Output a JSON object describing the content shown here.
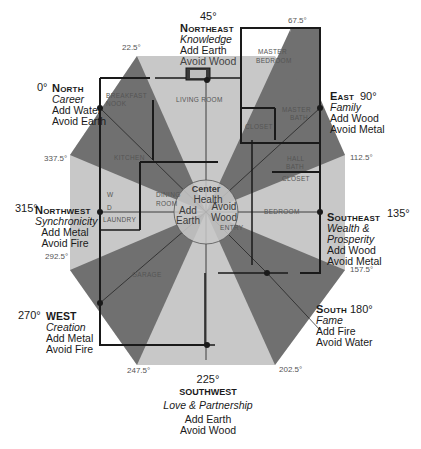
{
  "diagram": {
    "type": "feng-shui-bagua-floor-plan",
    "colors": {
      "dark_wedge": "#6f6f6f",
      "light_wedge": "#c8c8c8",
      "wall": "#1a1a1a",
      "background": "#ffffff"
    },
    "center": {
      "title": "Center",
      "area": "Health",
      "add": "Add Earth",
      "avoid": "Avoid Wood",
      "add_line1": "Add",
      "add_line2": "Earth",
      "avoid_line1": "Avoid",
      "avoid_line2": "Wood"
    },
    "directions": [
      {
        "id": "north",
        "degree": "0°",
        "name": "North",
        "area": "Career",
        "add": "Add Water",
        "avoid": "Avoid Earth"
      },
      {
        "id": "northeast",
        "degree": "45°",
        "name": "Northeast",
        "area": "Knowledge",
        "add": "Add Earth",
        "avoid": "Avoid Wood"
      },
      {
        "id": "east",
        "degree": "90°",
        "name": "East",
        "area": "Family",
        "add": "Add Wood",
        "avoid": "Avoid Metal"
      },
      {
        "id": "southeast",
        "degree": "135°",
        "name": "Southeast",
        "area_line1": "Wealth &",
        "area_line2": "Prosperity",
        "add": "Add Wood",
        "avoid": "Avoid Metal"
      },
      {
        "id": "south",
        "degree": "180°",
        "name": "South",
        "area": "Fame",
        "add": "Add Fire",
        "avoid": "Avoid Water"
      },
      {
        "id": "southwest",
        "degree": "225°",
        "name": "SOUTHWEST",
        "area": "Love & Partnership",
        "add": "Add Earth",
        "avoid": "Avoid Wood"
      },
      {
        "id": "west",
        "degree": "270°",
        "name": "WEST",
        "area": "Creation",
        "add": "Add Metal",
        "avoid": "Avoid Fire"
      },
      {
        "id": "northwest",
        "degree": "315°",
        "name": "Northwest",
        "area": "Synchronicity",
        "add": "Add Metal",
        "avoid": "Avoid Fire"
      }
    ],
    "boundary_ticks": [
      {
        "id": "t22",
        "label": "22.5°"
      },
      {
        "id": "t67",
        "label": "67.5°"
      },
      {
        "id": "t112",
        "label": "112.5°"
      },
      {
        "id": "t157",
        "label": "157.5°"
      },
      {
        "id": "t202",
        "label": "202.5°"
      },
      {
        "id": "t247",
        "label": "247.5°"
      },
      {
        "id": "t292",
        "label": "292.5°"
      },
      {
        "id": "t337",
        "label": "337.5°"
      }
    ],
    "rooms": {
      "master_bedroom_1": "MASTER",
      "master_bedroom_2": "BEDROOM",
      "breakfast_nook_1": "BREAKFAST",
      "breakfast_nook_2": "NOOK",
      "living_room": "LIVING ROOM",
      "kitchen": "KITCHEN",
      "dining_room_1": "DINING",
      "dining_room_2": "ROOM",
      "laundry": "LAUNDRY",
      "washer": "W",
      "dryer": "D",
      "garage": "GARAGE",
      "closet_1": "CLOSET",
      "master_bath_1": "MASTER",
      "master_bath_2": "BATH",
      "hall_bath_1": "HALL",
      "hall_bath_2": "BATH",
      "closet_2": "CLOSET",
      "bedroom": "BEDROOM",
      "entry": "ENTRY"
    }
  }
}
